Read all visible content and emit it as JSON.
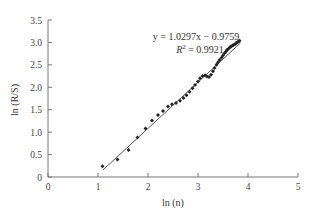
{
  "chart_data": {
    "type": "scatter",
    "title": "",
    "xlabel": "ln (n)",
    "ylabel": "ln (R/S)",
    "xlim": [
      0,
      5
    ],
    "ylim": [
      0,
      3.5
    ],
    "x_ticks": [
      "0",
      "1",
      "2",
      "3",
      "4",
      "5"
    ],
    "y_ticks": [
      "0",
      "0.5",
      "1.0",
      "1.5",
      "2.0",
      "2.5",
      "3.0",
      "3.5"
    ],
    "grid": false,
    "legend": null,
    "series": [
      {
        "name": "ln(R/S) vs ln(n)",
        "marker": "diamond",
        "color": "#222222",
        "x": [
          1.09,
          1.39,
          1.61,
          1.79,
          1.95,
          2.08,
          2.2,
          2.3,
          2.4,
          2.48,
          2.56,
          2.64,
          2.71,
          2.77,
          2.83,
          2.89,
          2.94,
          3.0,
          3.04,
          3.09,
          3.14,
          3.18,
          3.22,
          3.26,
          3.3,
          3.33,
          3.37,
          3.4,
          3.43,
          3.47,
          3.5,
          3.53,
          3.56,
          3.58,
          3.61,
          3.64,
          3.66,
          3.69,
          3.71,
          3.74,
          3.76,
          3.78,
          3.81,
          3.83
        ],
        "y": [
          0.24,
          0.39,
          0.6,
          0.88,
          1.08,
          1.26,
          1.38,
          1.47,
          1.57,
          1.62,
          1.65,
          1.7,
          1.76,
          1.82,
          1.9,
          1.98,
          2.05,
          2.13,
          2.2,
          2.25,
          2.27,
          2.24,
          2.23,
          2.28,
          2.36,
          2.43,
          2.5,
          2.56,
          2.61,
          2.66,
          2.71,
          2.76,
          2.8,
          2.83,
          2.86,
          2.89,
          2.91,
          2.93,
          2.94,
          2.96,
          2.98,
          3.0,
          3.02,
          3.04
        ]
      }
    ],
    "trendline": {
      "type": "linear",
      "slope": 1.0297,
      "intercept": -0.9759,
      "r_squared": 0.9921,
      "x_range": [
        1.1,
        3.85
      ],
      "color": "#555555"
    },
    "annotations": [
      {
        "text": "y = 1.0297x − 0.9759",
        "x": 3.1,
        "y": 3.08
      },
      {
        "text": "R² = 0.9921",
        "x": 3.1,
        "y": 2.82
      }
    ]
  },
  "labels": {
    "equation": "y = 1.0297x − 0.9759",
    "r2_prefix": "R",
    "r2_sup": "2",
    "r2_value": " = 0.9921",
    "xlabel": "ln (n)",
    "ylabel": "ln (R/S)"
  }
}
